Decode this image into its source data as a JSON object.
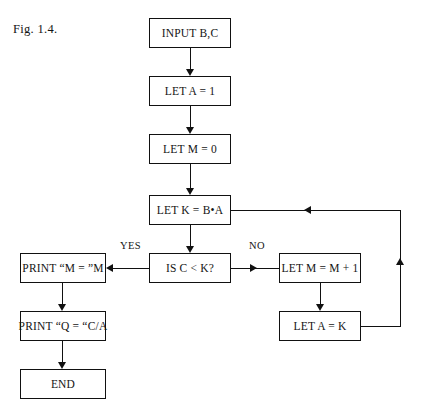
{
  "figure": {
    "caption": "Fig. 1.4."
  },
  "colors": {
    "stroke": "#111111",
    "background": "#ffffff",
    "text": "#141414"
  },
  "nodes": [
    {
      "id": "input-bc",
      "label": "INPUT B,C",
      "x": 149,
      "y": 18,
      "w": 82,
      "h": 30,
      "shape": "process"
    },
    {
      "id": "let-a-1",
      "label": "LET A = 1",
      "x": 149,
      "y": 76,
      "w": 82,
      "h": 30,
      "shape": "process"
    },
    {
      "id": "let-m-0",
      "label": "LET M = 0",
      "x": 149,
      "y": 134,
      "w": 82,
      "h": 30,
      "shape": "process"
    },
    {
      "id": "let-k-ba",
      "label": "LET K = B•A",
      "x": 149,
      "y": 195,
      "w": 82,
      "h": 30,
      "shape": "process"
    },
    {
      "id": "is-c-lt-k",
      "label": "IS C < K?",
      "x": 149,
      "y": 253,
      "w": 82,
      "h": 30,
      "shape": "decision"
    },
    {
      "id": "print-m",
      "label": "PRINT  “M = ”M",
      "x": 20,
      "y": 253,
      "w": 86,
      "h": 30,
      "shape": "process"
    },
    {
      "id": "print-q",
      "label": "PRINT “Q = “C/A",
      "x": 20,
      "y": 311,
      "w": 86,
      "h": 30,
      "shape": "process"
    },
    {
      "id": "end",
      "label": "END",
      "x": 20,
      "y": 369,
      "w": 86,
      "h": 30,
      "shape": "terminal"
    },
    {
      "id": "let-m-m1",
      "label": "LET M = M + 1",
      "x": 279,
      "y": 253,
      "w": 82,
      "h": 30,
      "shape": "process"
    },
    {
      "id": "let-a-k",
      "label": "LET A = K",
      "x": 279,
      "y": 311,
      "w": 82,
      "h": 30,
      "shape": "process"
    }
  ],
  "edge_labels": [
    {
      "id": "yes",
      "text": "YES",
      "x": 120,
      "y": 240
    },
    {
      "id": "no",
      "text": "NO",
      "x": 249,
      "y": 240
    }
  ]
}
